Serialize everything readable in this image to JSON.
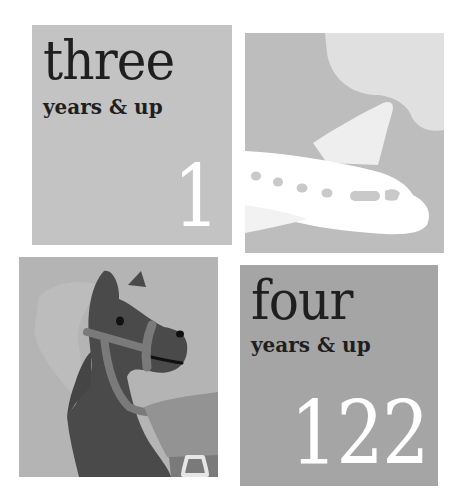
{
  "tiles": {
    "three": {
      "age_word": "three",
      "subtitle": "years & up",
      "page_number": "1",
      "background": "#c3c3c3"
    },
    "plane": {
      "illustration": "airplane-icon",
      "background": "#bdbdbd",
      "cloud_color": "#e0e0e0",
      "plane_color": "#ffffff"
    },
    "horse": {
      "illustration": "horse-icon",
      "background": "#b4b4b4",
      "horse_color": "#4a4a4a",
      "bridle_color": "#7a7a7a",
      "saddle_color": "#939393"
    },
    "four": {
      "age_word": "four",
      "subtitle": "years & up",
      "page_number": "122",
      "background": "#a5a5a5"
    }
  }
}
